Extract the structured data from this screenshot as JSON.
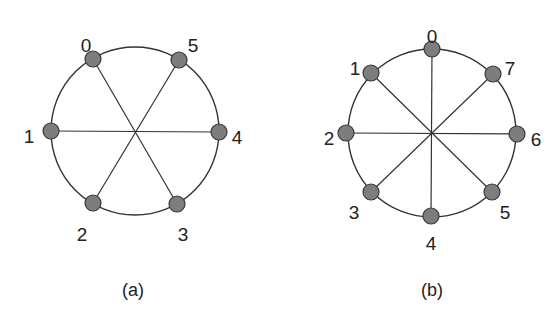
{
  "diagrams": [
    {
      "caption": "(a)",
      "node_count": 6,
      "center": [
        135,
        131
      ],
      "radius": 84,
      "nodes": [
        {
          "id": "0",
          "x": 93,
          "y": 59,
          "label_x": 86,
          "label_y": 47
        },
        {
          "id": "1",
          "x": 51,
          "y": 131,
          "label_x": 29,
          "label_y": 138
        },
        {
          "id": "2",
          "x": 93,
          "y": 203,
          "label_x": 82,
          "label_y": 236
        },
        {
          "id": "3",
          "x": 177,
          "y": 204,
          "label_x": 183,
          "label_y": 236
        },
        {
          "id": "4",
          "x": 219,
          "y": 132,
          "label_x": 237,
          "label_y": 139
        },
        {
          "id": "5",
          "x": 179,
          "y": 60,
          "label_x": 193,
          "label_y": 47
        }
      ],
      "spokes": [
        [
          "0",
          "3"
        ],
        [
          "1",
          "4"
        ],
        [
          "2",
          "5"
        ]
      ],
      "caption_pos": [
        133,
        291
      ]
    },
    {
      "caption": "(b)",
      "node_count": 8,
      "center": [
        432,
        133
      ],
      "radius": 84,
      "nodes": [
        {
          "id": "0",
          "x": 432,
          "y": 49,
          "label_x": 432,
          "label_y": 38
        },
        {
          "id": "1",
          "x": 371,
          "y": 73,
          "label_x": 355,
          "label_y": 70
        },
        {
          "id": "2",
          "x": 346,
          "y": 133,
          "label_x": 329,
          "label_y": 140
        },
        {
          "id": "3",
          "x": 371,
          "y": 192,
          "label_x": 354,
          "label_y": 214
        },
        {
          "id": "4",
          "x": 431,
          "y": 216,
          "label_x": 431,
          "label_y": 245
        },
        {
          "id": "5",
          "x": 492,
          "y": 192,
          "label_x": 505,
          "label_y": 214
        },
        {
          "id": "6",
          "x": 517,
          "y": 134,
          "label_x": 536,
          "label_y": 141
        },
        {
          "id": "7",
          "x": 493,
          "y": 74,
          "label_x": 510,
          "label_y": 70
        }
      ],
      "spokes": [
        [
          "0",
          "4"
        ],
        [
          "1",
          "5"
        ],
        [
          "2",
          "6"
        ],
        [
          "3",
          "7"
        ]
      ],
      "caption_pos": [
        432,
        291
      ]
    }
  ],
  "colors": {
    "node_fill": "#7d7d7d",
    "node_stroke": "#3a3a3a",
    "line": "#333333",
    "text": "#222222"
  }
}
